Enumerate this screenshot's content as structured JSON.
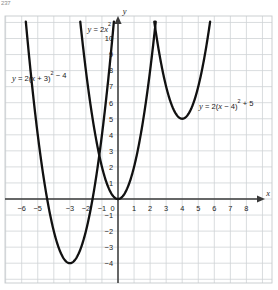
{
  "page": {
    "corner_note": "237"
  },
  "axes": {
    "x_axis_name": "x",
    "y_axis_name": "y",
    "x_ticks": [
      {
        "value": -6,
        "label": "−6",
        "visible": true
      },
      {
        "value": -5,
        "label": "−5",
        "visible": true
      },
      {
        "value": -4,
        "label": "−4",
        "visible": false
      },
      {
        "value": -3,
        "label": "−3",
        "visible": true
      },
      {
        "value": -2,
        "label": "−2",
        "visible": true
      },
      {
        "value": -1,
        "label": "−1",
        "visible": true
      },
      {
        "value": 0,
        "label": "0",
        "visible": true
      },
      {
        "value": 1,
        "label": "1",
        "visible": true
      },
      {
        "value": 2,
        "label": "2",
        "visible": true
      },
      {
        "value": 3,
        "label": "3",
        "visible": true
      },
      {
        "value": 4,
        "label": "4",
        "visible": true
      },
      {
        "value": 5,
        "label": "5",
        "visible": true
      },
      {
        "value": 6,
        "label": "6",
        "visible": true
      },
      {
        "value": 7,
        "label": "7",
        "visible": true
      },
      {
        "value": 8,
        "label": "8",
        "visible": true
      }
    ],
    "y_ticks": [
      {
        "value": 10,
        "label": "10"
      },
      {
        "value": 9,
        "label": "9"
      },
      {
        "value": 8,
        "label": "8"
      },
      {
        "value": 7,
        "label": "7"
      },
      {
        "value": 6,
        "label": "6"
      },
      {
        "value": 5,
        "label": "5"
      },
      {
        "value": 4,
        "label": "4"
      },
      {
        "value": 3,
        "label": "3"
      },
      {
        "value": 2,
        "label": "2"
      },
      {
        "value": 1,
        "label": "1"
      },
      {
        "value": -1,
        "label": "−1"
      },
      {
        "value": -2,
        "label": "−2"
      },
      {
        "value": -3,
        "label": "−3"
      },
      {
        "value": -4,
        "label": "−4"
      }
    ]
  },
  "chart_data": {
    "type": "line",
    "title": "",
    "xlabel": "x",
    "ylabel": "y",
    "xlim": [
      -7,
      9
    ],
    "ylim": [
      -5,
      11
    ],
    "grid": true,
    "legend": "inline-annotations",
    "curve_color": "#111111",
    "grid_color": "#cfd3d6",
    "axis_color": "#3a3a3a",
    "series": [
      {
        "name": "y = 2x²",
        "equation_plain": "y = 2x^2",
        "equation_label": "y = 2x²",
        "form": "y = a(x - h)^2 + k",
        "a": 2,
        "h": 0,
        "k": 0,
        "vertex": [
          0,
          0
        ],
        "label_position": [
          -1.9,
          10.4
        ],
        "points": [
          {
            "x": -2.35,
            "y": 11.0
          },
          {
            "x": -2,
            "y": 8
          },
          {
            "x": -1.5,
            "y": 4.5
          },
          {
            "x": -1,
            "y": 2
          },
          {
            "x": -0.5,
            "y": 0.5
          },
          {
            "x": 0,
            "y": 0
          },
          {
            "x": 0.5,
            "y": 0.5
          },
          {
            "x": 1,
            "y": 2
          },
          {
            "x": 1.5,
            "y": 4.5
          },
          {
            "x": 2,
            "y": 8
          },
          {
            "x": 2.35,
            "y": 11.0
          }
        ]
      },
      {
        "name": "y = 2(x + 3)² − 4",
        "equation_plain": "y = 2(x + 3)^2 - 4",
        "equation_label": "y = 2(x + 3)² − 4",
        "form": "y = a(x - h)^2 + k",
        "a": 2,
        "h": -3,
        "k": -4,
        "vertex": [
          -3,
          -4
        ],
        "label_position": [
          -6.6,
          7.35
        ],
        "points": [
          {
            "x": -5.34,
            "y": 7.0
          },
          {
            "x": -5,
            "y": 4
          },
          {
            "x": -4.5,
            "y": 0.5
          },
          {
            "x": -4,
            "y": -2
          },
          {
            "x": -3.5,
            "y": -3.5
          },
          {
            "x": -3,
            "y": -4
          },
          {
            "x": -2.5,
            "y": -3.5
          },
          {
            "x": -2,
            "y": -2
          },
          {
            "x": -1.5,
            "y": 0.5
          },
          {
            "x": -1,
            "y": 4
          },
          {
            "x": -0.66,
            "y": 7.0
          }
        ]
      },
      {
        "name": "y = 2(x − 4)² + 5",
        "equation_plain": "y = 2(x - 4)^2 + 5",
        "equation_label": "y = 2(x − 4)² + 5",
        "form": "y = a(x - h)^2 + k",
        "a": 2,
        "h": 4,
        "k": 5,
        "vertex": [
          4,
          5
        ],
        "label_position": [
          5.05,
          5.62
        ],
        "points": [
          {
            "x": 2.27,
            "y": 11.0
          },
          {
            "x": 2.5,
            "y": 9.5
          },
          {
            "x": 3,
            "y": 7
          },
          {
            "x": 3.5,
            "y": 5.5
          },
          {
            "x": 4,
            "y": 5
          },
          {
            "x": 4.5,
            "y": 5.5
          },
          {
            "x": 5,
            "y": 7
          },
          {
            "x": 5.5,
            "y": 9.5
          },
          {
            "x": 5.73,
            "y": 11.0
          }
        ]
      }
    ]
  }
}
